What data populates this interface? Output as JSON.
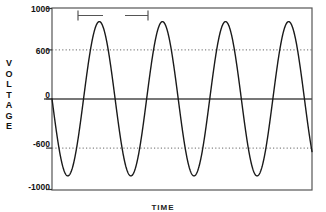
{
  "chart_data": {
    "type": "line",
    "title": "",
    "subtitle": "",
    "xlabel": "TIME",
    "ylabel": "VOLTAGE",
    "ylim": [
      -1000,
      1000
    ],
    "xlim": [
      0,
      4.12
    ],
    "ytick_labels": [
      "1000",
      "600",
      "0",
      "-600",
      "-1000"
    ],
    "ytick_values": [
      1000,
      600,
      0,
      -600,
      -1000
    ],
    "xtick_labels": [],
    "grid": "horizontal dotted gridlines at 600 and -600; solid line at 0",
    "legend": "none",
    "line_color": "#1a1a1a",
    "frame_color": "#444444",
    "grid_color": "#777777",
    "series": [
      {
        "name": "voltage",
        "waveform": "negative-going sine",
        "amplitude": 850,
        "cycles": 4.12,
        "phase_deg": 180,
        "y_offset": 0,
        "description": "AC voltage sine wave starting at 0 V and descending first, peak 850 V, trough -850 V, four full cycles plus a partial fifth descending to 0",
        "x": [
          0.0,
          0.05,
          0.1,
          0.15,
          0.2,
          0.25,
          0.3,
          0.35,
          0.4,
          0.45,
          0.5,
          0.55,
          0.6,
          0.65,
          0.7,
          0.75,
          0.8,
          0.85,
          0.9,
          0.95,
          1.0
        ],
        "y_one_cycle": [
          0,
          -263,
          -500,
          -688,
          -808,
          -850,
          -808,
          -688,
          -500,
          -263,
          0,
          263,
          500,
          688,
          808,
          850,
          808,
          688,
          500,
          263,
          0
        ]
      }
    ],
    "annotations": [
      {
        "name": "period-bracket",
        "label": "λ",
        "kind": "span-bracket",
        "from_cycle": 0.5,
        "to_cycle": 1.5,
        "position": "top of plot area",
        "meaning": "one full wavelength / period"
      }
    ]
  },
  "axis": {
    "y_tick_1000": "1000",
    "y_tick_600": "600",
    "y_tick_0": "0",
    "y_tick_neg600": "-600",
    "y_tick_neg1000": "-1000",
    "y_title_letters": [
      "V",
      "O",
      "L",
      "T",
      "A",
      "G",
      "E"
    ],
    "x_title": "TIME"
  },
  "annotation": {
    "period_label": "λ"
  }
}
